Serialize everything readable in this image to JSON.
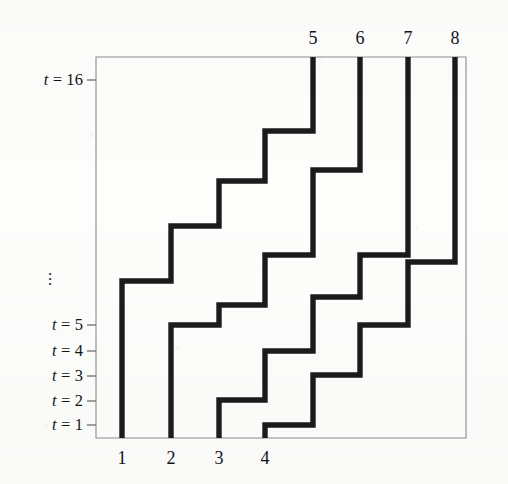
{
  "figure": {
    "type": "lattice-path-diagram",
    "plot_area": {
      "left": 96,
      "right": 466,
      "top": 57,
      "bottom": 438
    },
    "line_color": "#1b1b1b",
    "frame_color": "#8d8d8d",
    "background": "#fdfdfc"
  },
  "axes": {
    "bottom_labels": [
      {
        "text": "1",
        "x": 122
      },
      {
        "text": "2",
        "x": 171
      },
      {
        "text": "3",
        "x": 219
      },
      {
        "text": "4",
        "x": 265
      }
    ],
    "top_labels": [
      {
        "text": "5",
        "x": 313
      },
      {
        "text": "6",
        "x": 360
      },
      {
        "text": "7",
        "x": 408
      },
      {
        "text": "8",
        "x": 455
      }
    ],
    "time_labels": [
      {
        "text": "t = 16",
        "y": 80,
        "value": 16
      },
      {
        "text": "t = 5",
        "y": 325,
        "value": 5
      },
      {
        "text": "t = 4",
        "y": 351,
        "value": 4
      },
      {
        "text": "t = 3",
        "y": 376,
        "value": 3
      },
      {
        "text": "t = 2",
        "y": 401,
        "value": 2
      },
      {
        "text": "t = 1",
        "y": 425,
        "value": 1
      }
    ],
    "ellipsis": {
      "text": "⋮",
      "x": 50,
      "y": 272
    }
  },
  "chart_data": {
    "type": "line",
    "title": "",
    "xlabel": "",
    "ylabel": "",
    "grid": false,
    "legend": null,
    "xlim": [
      96,
      466
    ],
    "ylim": [
      438,
      57
    ],
    "x_tick_labels": [
      "1",
      "2",
      "3",
      "4",
      "5",
      "6",
      "7",
      "8"
    ],
    "y_tick_labels": [
      "t = 1",
      "t = 2",
      "t = 3",
      "t = 4",
      "t = 5",
      "t = 16"
    ],
    "series": [
      {
        "name": "path-1",
        "start_label": "1",
        "end_label": "5",
        "points": "122,438 122,281 171,281 171,226 219,226 219,181 265,181 265,131 313,131 313,57"
      },
      {
        "name": "path-2",
        "start_label": "2",
        "end_label": "6",
        "points": "171,438 171,325 219,325 219,305 265,305 265,255 313,255 313,170 360,170 360,57"
      },
      {
        "name": "path-3",
        "start_label": "3",
        "end_label": "7",
        "points": "219,438 219,400 265,400 265,351 313,351 313,297 360,297 360,255 408,255 408,57"
      },
      {
        "name": "path-4",
        "start_label": "4",
        "end_label": "8",
        "points": "265,438 265,425 313,425 313,375 360,375 360,325 408,325 408,262 455,262 455,57"
      }
    ]
  }
}
